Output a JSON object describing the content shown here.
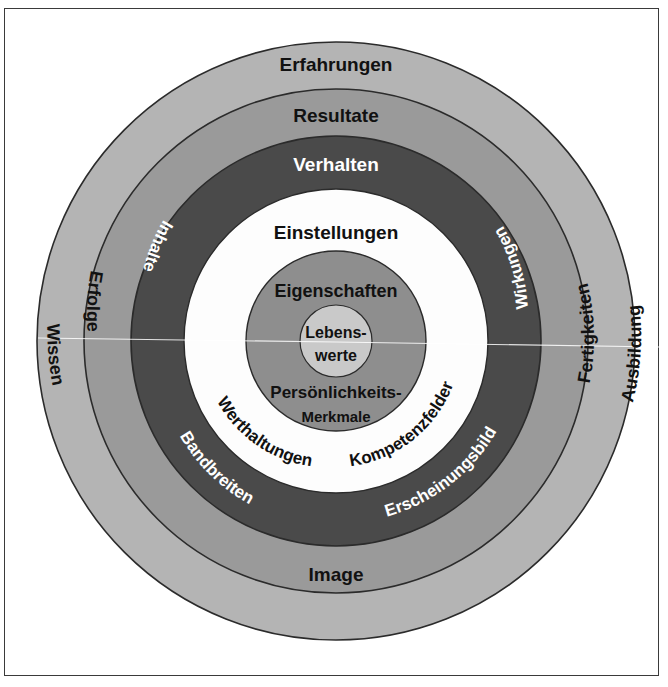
{
  "figure": {
    "type": "concentric-rings-diagram",
    "language": "de",
    "frame": {
      "visible": true,
      "color": "#3a3a3a"
    },
    "center": {
      "cx": 336,
      "cy": 341
    }
  },
  "colors": {
    "ring_outer": "#b4b4b4",
    "ring_second": "#9a9a9a",
    "ring_dark": "#4a4a4a",
    "ring_white": "#fdfdfd",
    "ring_core": "#8e8e8e",
    "center_disc": "#c9c9c9",
    "outline": "#2b2b2b",
    "text_dark": "#111111",
    "text_light": "#ffffff"
  },
  "rings": [
    {
      "id": "ring-1-erfahrungen",
      "name": "Erfahrungen",
      "radius": 299,
      "fill": "#b4b4b4",
      "labels": [
        {
          "text": "Erfahrungen",
          "position": "top",
          "style": "dark"
        },
        {
          "text": "Wissen",
          "position": "lower-left",
          "style": "dark"
        },
        {
          "text": "Ausbildung",
          "position": "lower-right",
          "style": "dark"
        }
      ]
    },
    {
      "id": "ring-2-resultate",
      "name": "Resultate",
      "radius": 252,
      "fill": "#9a9a9a",
      "labels": [
        {
          "text": "Resultate",
          "position": "top",
          "style": "dark"
        },
        {
          "text": "Erfolge",
          "position": "upper-left",
          "style": "dark"
        },
        {
          "text": "Fertigkeiten",
          "position": "right",
          "style": "dark"
        },
        {
          "text": "Image",
          "position": "bottom",
          "style": "dark"
        }
      ]
    },
    {
      "id": "ring-3-verhalten",
      "name": "Verhalten",
      "radius": 205,
      "fill": "#4a4a4a",
      "labels": [
        {
          "text": "Verhalten",
          "position": "top",
          "style": "light"
        },
        {
          "text": "Inhalte",
          "position": "upper-left",
          "style": "light"
        },
        {
          "text": "Wirkungen",
          "position": "upper-right",
          "style": "light"
        },
        {
          "text": "Bandbreiten",
          "position": "lower-left",
          "style": "light"
        },
        {
          "text": "Erscheinungsbild",
          "position": "lower-right",
          "style": "light"
        }
      ]
    },
    {
      "id": "ring-4-einstellungen",
      "name": "Einstellungen",
      "radius": 152,
      "fill": "#fdfdfd",
      "labels": [
        {
          "text": "Einstellungen",
          "position": "top",
          "style": "dark"
        },
        {
          "text": "Werthaltungen",
          "position": "lower-left",
          "style": "dark"
        },
        {
          "text": "Kompetenzfelder",
          "position": "lower-right",
          "style": "dark"
        }
      ]
    },
    {
      "id": "ring-5-eigenschaften",
      "name": "Eigenschaften",
      "radius": 90,
      "fill": "#8e8e8e",
      "labels": [
        {
          "text": "Eigenschaften",
          "position": "top",
          "style": "dark"
        },
        {
          "text": "Persönlichkeits-",
          "position": "bottom-line-1",
          "style": "dark"
        },
        {
          "text": "Merkmale",
          "position": "bottom-line-2",
          "style": "dark"
        }
      ]
    },
    {
      "id": "center-lebenswerte",
      "name": "Lebenswerte",
      "radius": 36,
      "fill": "#c9c9c9",
      "labels": [
        {
          "text": "Lebens-",
          "position": "center-line-1",
          "style": "dark"
        },
        {
          "text": "werte",
          "position": "center-line-2",
          "style": "dark"
        }
      ]
    }
  ],
  "labels": {
    "erfahrungen": "Erfahrungen",
    "wissen": "Wissen",
    "ausbildung": "Ausbildung",
    "resultate": "Resultate",
    "erfolge": "Erfolge",
    "fertigkeiten": "Fertigkeiten",
    "image": "Image",
    "verhalten": "Verhalten",
    "inhalte": "Inhalte",
    "wirkungen": "Wirkungen",
    "bandbreiten": "Bandbreiten",
    "erscheinungsbild": "Erscheinungsbild",
    "einstellungen": "Einstellungen",
    "werthaltungen": "Werthaltungen",
    "kompetenzfelder": "Kompetenzfelder",
    "eigenschaften": "Eigenschaften",
    "persoenlichkeits": "Persönlichkeits-",
    "merkmale": "Merkmale",
    "lebens": "Lebens-",
    "werte": "werte"
  }
}
